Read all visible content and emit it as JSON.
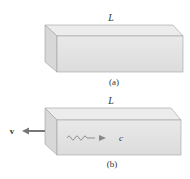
{
  "figure": {
    "panel_a": {
      "length_label": "L",
      "caption": "(a)"
    },
    "panel_b": {
      "length_label": "L",
      "caption": "(b)",
      "velocity_label": "v",
      "light_speed_label": "c"
    }
  },
  "colors": {
    "box_front": "#e3e3e3",
    "box_top": "#ececec",
    "box_side": "#d6d6d6",
    "edge": "#9a9a9a",
    "arrow": "#777777",
    "wave": "#888888"
  }
}
